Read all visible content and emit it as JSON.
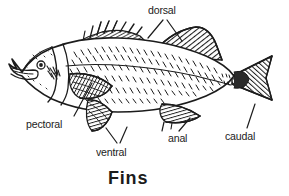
{
  "diagram": {
    "caption": "Fins",
    "background_color": "#ffffff",
    "ink_color": "#1c1c1c",
    "labels": [
      {
        "id": "dorsal",
        "text": "dorsal",
        "leader": "double-v",
        "points_to": "dorsal fins (spiny + soft)"
      },
      {
        "id": "pectoral",
        "text": "pectoral",
        "leader": "single",
        "points_to": "pectoral fin"
      },
      {
        "id": "ventral",
        "text": "ventral",
        "leader": "double-v",
        "points_to": "ventral (pelvic) fins"
      },
      {
        "id": "anal",
        "text": "anal",
        "leader": "single",
        "points_to": "anal fin"
      },
      {
        "id": "caudal",
        "text": "caudal",
        "leader": "single",
        "points_to": "caudal (tail) fin"
      }
    ],
    "fish": {
      "parts": [
        "head",
        "eye",
        "mouth",
        "gill-cover",
        "body-scales",
        "lateral-line",
        "spiny-dorsal-fin",
        "soft-dorsal-fin",
        "pectoral-fin",
        "ventral-fin",
        "anal-fin",
        "caudal-fin"
      ]
    }
  }
}
